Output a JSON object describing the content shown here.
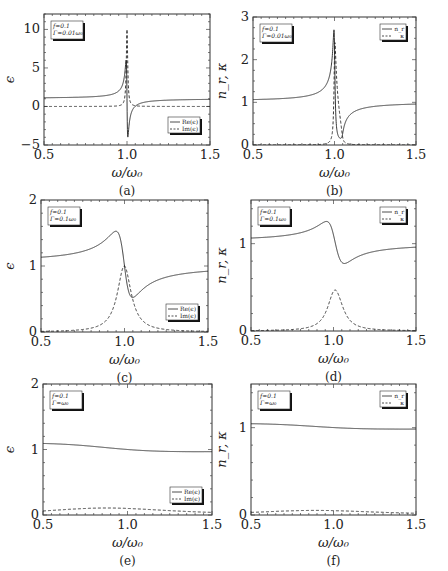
{
  "figure": {
    "x_axis_label": "ω/ω₀",
    "x_ticks": [
      "0.5",
      "1.0",
      "1.5"
    ]
  },
  "chart_data": [
    {
      "panel": "(a)",
      "type": "line",
      "xlabel": "ω/ω₀",
      "ylabel": "ϵ",
      "xlim": [
        0.5,
        1.5
      ],
      "ylim": [
        -5,
        12
      ],
      "yticks": [
        -5,
        0,
        5,
        10
      ],
      "annotation": [
        "f=0.1",
        "Γ=0.01ω₀"
      ],
      "legend": [
        "Re(ϵ)",
        "Im(ϵ)"
      ],
      "legend_position": "lower right",
      "params": {
        "f": 0.1,
        "gamma": 0.01,
        "quantity": "eps"
      },
      "series": [
        {
          "name": "Re(ϵ)",
          "style": "solid",
          "x": [
            0.5,
            0.8,
            0.95,
            0.99,
            1.0,
            1.01,
            1.03,
            1.1,
            1.3,
            1.5
          ],
          "values": [
            1.11,
            1.2,
            1.55,
            4.5,
            6.2,
            -4.2,
            -0.5,
            0.6,
            0.92,
            0.97
          ]
        },
        {
          "name": "Im(ϵ)",
          "style": "dashed",
          "x": [
            0.5,
            0.95,
            0.99,
            1.0,
            1.01,
            1.05,
            1.5
          ],
          "values": [
            0.0,
            0.05,
            2.5,
            10.0,
            2.5,
            0.05,
            0.0
          ]
        }
      ]
    },
    {
      "panel": "(b)",
      "type": "line",
      "xlabel": "ω/ω₀",
      "ylabel": "n_r, κ",
      "xlim": [
        0.5,
        1.5
      ],
      "ylim": [
        0,
        3
      ],
      "yticks": [
        0,
        1,
        2,
        3
      ],
      "annotation": [
        "f=0.1",
        "Γ=0.01ω₀"
      ],
      "legend": [
        "n_r",
        "κ"
      ],
      "legend_position": "upper right",
      "params": {
        "f": 0.1,
        "gamma": 0.01,
        "quantity": "n"
      },
      "series": [
        {
          "name": "n_r",
          "style": "solid",
          "x": [
            0.5,
            0.8,
            0.95,
            0.99,
            1.0,
            1.02,
            1.04,
            1.06,
            1.1,
            1.3,
            1.5
          ],
          "values": [
            1.05,
            1.1,
            1.25,
            2.1,
            2.65,
            0.7,
            0.15,
            0.2,
            0.7,
            0.92,
            0.97
          ]
        },
        {
          "name": "κ",
          "style": "dashed",
          "x": [
            0.5,
            0.97,
            1.0,
            1.03,
            1.06,
            1.5
          ],
          "values": [
            0.0,
            0.1,
            2.35,
            1.5,
            0.05,
            0.0
          ]
        }
      ]
    },
    {
      "panel": "(c)",
      "type": "line",
      "xlabel": "ω/ω₀",
      "ylabel": "ϵ",
      "xlim": [
        0.5,
        1.5
      ],
      "ylim": [
        0,
        2
      ],
      "yticks": [
        0,
        1,
        2
      ],
      "annotation": [
        "f=0.1",
        "Γ=0.1ω₀"
      ],
      "legend": [
        "Re(ϵ)",
        "Im(ϵ)"
      ],
      "legend_position": "lower right",
      "params": {
        "f": 0.1,
        "gamma": 0.1,
        "quantity": "eps"
      },
      "series": [
        {
          "name": "Re(ϵ)",
          "style": "solid",
          "x": [
            0.5,
            0.7,
            0.85,
            0.95,
            1.0,
            1.05,
            1.1,
            1.3,
            1.5
          ],
          "values": [
            1.13,
            1.18,
            1.3,
            1.55,
            1.05,
            0.52,
            0.68,
            0.86,
            0.94
          ]
        },
        {
          "name": "Im(ϵ)",
          "style": "dashed",
          "x": [
            0.5,
            0.8,
            0.9,
            0.95,
            1.0,
            1.05,
            1.1,
            1.2,
            1.5
          ],
          "values": [
            0.0,
            0.06,
            0.18,
            0.4,
            1.0,
            0.45,
            0.2,
            0.07,
            0.02
          ]
        }
      ]
    },
    {
      "panel": "(d)",
      "type": "line",
      "xlabel": "ω/ω₀",
      "ylabel": "n_r, κ",
      "xlim": [
        0.5,
        1.5
      ],
      "ylim": [
        0,
        1.5
      ],
      "yticks": [
        0,
        1
      ],
      "annotation": [
        "f=0.1",
        "Γ=0.1ω₀"
      ],
      "legend": [
        "n_r",
        "κ"
      ],
      "legend_position": "upper right",
      "params": {
        "f": 0.1,
        "gamma": 0.1,
        "quantity": "n"
      },
      "series": [
        {
          "name": "n_r",
          "style": "solid",
          "x": [
            0.5,
            0.7,
            0.85,
            0.96,
            1.0,
            1.06,
            1.1,
            1.3,
            1.5
          ],
          "values": [
            1.06,
            1.1,
            1.15,
            1.24,
            1.05,
            0.77,
            0.8,
            0.92,
            0.97
          ]
        },
        {
          "name": "κ",
          "style": "dashed",
          "x": [
            0.5,
            0.8,
            0.9,
            0.95,
            1.01,
            1.05,
            1.1,
            1.2,
            1.5
          ],
          "values": [
            0.0,
            0.04,
            0.1,
            0.22,
            0.48,
            0.25,
            0.12,
            0.04,
            0.01
          ]
        }
      ]
    },
    {
      "panel": "(e)",
      "type": "line",
      "xlabel": "ω/ω₀",
      "ylabel": "ϵ",
      "xlim": [
        0.5,
        1.5
      ],
      "ylim": [
        0,
        2
      ],
      "yticks": [
        0,
        1,
        2
      ],
      "annotation": [
        "f=0.1",
        "Γ=ω₀"
      ],
      "legend": [
        "Re(ϵ)",
        "Im(ϵ)"
      ],
      "legend_position": "lower right",
      "params": {
        "f": 0.1,
        "gamma": 1.0,
        "quantity": "eps"
      },
      "series": [
        {
          "name": "Re(ϵ)",
          "style": "solid",
          "x": [
            0.5,
            0.8,
            1.0,
            1.15,
            1.5
          ],
          "values": [
            1.08,
            1.04,
            1.0,
            0.97,
            0.97
          ]
        },
        {
          "name": "Im(ϵ)",
          "style": "dashed",
          "x": [
            0.5,
            0.8,
            1.0,
            1.2,
            1.5
          ],
          "values": [
            0.03,
            0.06,
            0.07,
            0.06,
            0.03
          ]
        }
      ]
    },
    {
      "panel": "(f)",
      "type": "line",
      "xlabel": "ω/ω₀",
      "ylabel": "n_r, κ",
      "xlim": [
        0.5,
        1.5
      ],
      "ylim": [
        0,
        1.5
      ],
      "yticks": [
        0,
        1
      ],
      "annotation": [
        "f=0.1",
        "Γ=ω₀"
      ],
      "legend": [
        "n_r",
        "κ"
      ],
      "legend_position": "upper right",
      "params": {
        "f": 0.1,
        "gamma": 1.0,
        "quantity": "n"
      },
      "series": [
        {
          "name": "n_r",
          "style": "solid",
          "x": [
            0.5,
            0.8,
            1.0,
            1.2,
            1.5
          ],
          "values": [
            1.04,
            1.02,
            1.0,
            0.99,
            0.98
          ]
        },
        {
          "name": "κ",
          "style": "dashed",
          "x": [
            0.5,
            0.8,
            1.0,
            1.2,
            1.5
          ],
          "values": [
            0.015,
            0.03,
            0.035,
            0.03,
            0.015
          ]
        }
      ]
    }
  ]
}
